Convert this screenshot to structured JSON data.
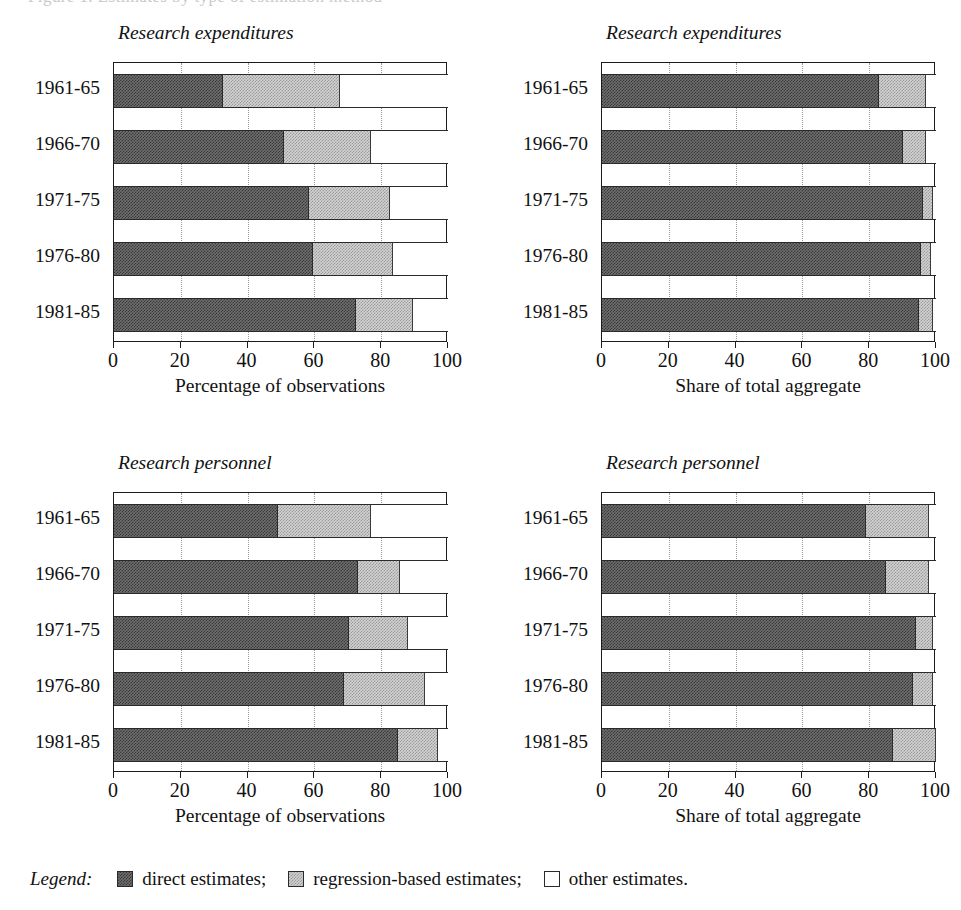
{
  "top_sliver_text": "Figure 1.  Estimates by type of estimation method",
  "legend": {
    "label": "Legend:",
    "entries": [
      {
        "name": "direct-estimates",
        "text": "direct estimates;",
        "swatch": "dark-hatched-swatch",
        "color": "#6e6e6e"
      },
      {
        "name": "regression-based-estimates",
        "text": "regression-based estimates;",
        "swatch": "light-hatched-swatch",
        "color": "#d2d2d2"
      },
      {
        "name": "other-estimates",
        "text": "other estimates.",
        "swatch": "empty-swatch",
        "color": "#ffffff"
      }
    ]
  },
  "chart_data": [
    {
      "id": "research-expenditures-observations",
      "type": "bar",
      "orientation": "horizontal",
      "stacked": true,
      "position": "top-left",
      "title": "Research expenditures",
      "xlabel": "Percentage of observations",
      "ylabel": "",
      "xlim": [
        0,
        100
      ],
      "xticks": [
        0,
        20,
        40,
        60,
        80,
        100
      ],
      "xticklabels": [
        "0",
        "20",
        "40",
        "60",
        "80",
        "100"
      ],
      "grid": "vertical-dotted",
      "legend_position": "figure-bottom",
      "categories": [
        "1961-65",
        "1966-70",
        "1971-75",
        "1976-80",
        "1981-85"
      ],
      "series": [
        {
          "name": "direct estimates",
          "values": [
            32.6,
            51.0,
            58.4,
            59.5,
            72.5
          ]
        },
        {
          "name": "regression-based estimates",
          "values": [
            35.1,
            26.0,
            24.2,
            24.0,
            17.0
          ]
        },
        {
          "name": "other estimates",
          "values": [
            32.3,
            23.0,
            17.4,
            16.5,
            10.5
          ]
        }
      ]
    },
    {
      "id": "research-expenditures-aggregate",
      "type": "bar",
      "orientation": "horizontal",
      "stacked": true,
      "position": "top-right",
      "title": "Research expenditures",
      "xlabel": "Share of total aggregate",
      "ylabel": "",
      "xlim": [
        0,
        100
      ],
      "xticks": [
        0,
        20,
        40,
        60,
        80,
        100
      ],
      "xticklabels": [
        "0",
        "20",
        "40",
        "60",
        "80",
        "100"
      ],
      "grid": "vertical-dotted",
      "legend_position": "figure-bottom",
      "categories": [
        "1961-65",
        "1966-70",
        "1971-75",
        "1976-80",
        "1981-85"
      ],
      "series": [
        {
          "name": "direct estimates",
          "values": [
            83.0,
            90.0,
            96.0,
            95.5,
            95.0
          ]
        },
        {
          "name": "regression-based estimates",
          "values": [
            14.0,
            7.0,
            3.0,
            3.0,
            4.0
          ]
        },
        {
          "name": "other estimates",
          "values": [
            3.0,
            3.0,
            1.0,
            1.5,
            1.0
          ]
        }
      ]
    },
    {
      "id": "research-personnel-observations",
      "type": "bar",
      "orientation": "horizontal",
      "stacked": true,
      "position": "bottom-left",
      "title": "Research personnel",
      "xlabel": "Percentage of observations",
      "ylabel": "",
      "xlim": [
        0,
        100
      ],
      "xticks": [
        0,
        20,
        40,
        60,
        80,
        100
      ],
      "xticklabels": [
        "0",
        "20",
        "40",
        "60",
        "80",
        "100"
      ],
      "grid": "vertical-dotted",
      "legend_position": "figure-bottom",
      "categories": [
        "1961-65",
        "1966-70",
        "1971-75",
        "1976-80",
        "1981-85"
      ],
      "series": [
        {
          "name": "direct estimates",
          "values": [
            49.0,
            73.0,
            70.5,
            69.0,
            85.0
          ]
        },
        {
          "name": "regression-based estimates",
          "values": [
            28.0,
            12.5,
            17.5,
            24.0,
            12.0
          ]
        },
        {
          "name": "other estimates",
          "values": [
            23.0,
            14.5,
            12.0,
            7.0,
            3.0
          ]
        }
      ]
    },
    {
      "id": "research-personnel-aggregate",
      "type": "bar",
      "orientation": "horizontal",
      "stacked": true,
      "position": "bottom-right",
      "title": "Research personnel",
      "xlabel": "Share of total aggregate",
      "ylabel": "",
      "xlim": [
        0,
        100
      ],
      "xticks": [
        0,
        20,
        40,
        60,
        80,
        100
      ],
      "xticklabels": [
        "0",
        "20",
        "40",
        "60",
        "80",
        "100"
      ],
      "grid": "vertical-dotted",
      "legend_position": "figure-bottom",
      "categories": [
        "1961-65",
        "1966-70",
        "1971-75",
        "1976-80",
        "1981-85"
      ],
      "series": [
        {
          "name": "direct estimates",
          "values": [
            79.0,
            85.0,
            94.0,
            93.0,
            87.0
          ]
        },
        {
          "name": "regression-based estimates",
          "values": [
            19.0,
            13.0,
            5.0,
            6.0,
            13.0
          ]
        },
        {
          "name": "other estimates",
          "values": [
            2.0,
            2.0,
            1.0,
            1.0,
            0.0
          ]
        }
      ]
    }
  ]
}
